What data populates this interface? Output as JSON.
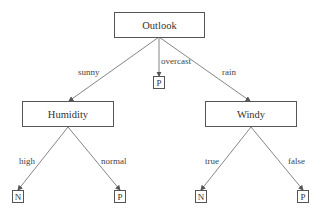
{
  "diagram": {
    "type": "decision-tree",
    "nodes": {
      "root": {
        "label": "Outlook"
      },
      "humidity": {
        "label": "Humidity"
      },
      "windy": {
        "label": "Windy"
      },
      "overcast_leaf": {
        "label": "P"
      },
      "high_leaf": {
        "label": "N"
      },
      "normal_leaf": {
        "label": "P"
      },
      "true_leaf": {
        "label": "N"
      },
      "false_leaf": {
        "label": "P"
      }
    },
    "edges": {
      "sunny": {
        "label": "sunny",
        "from": "Outlook",
        "to": "Humidity"
      },
      "overcast": {
        "label": "overcast",
        "from": "Outlook",
        "to": "P"
      },
      "rain": {
        "label": "rain",
        "from": "Outlook",
        "to": "Windy"
      },
      "high": {
        "label": "high",
        "from": "Humidity",
        "to": "N"
      },
      "normal": {
        "label": "normal",
        "from": "Humidity",
        "to": "P"
      },
      "true": {
        "label": "true",
        "from": "Windy",
        "to": "N"
      },
      "false": {
        "label": "false",
        "from": "Windy",
        "to": "P"
      }
    },
    "colors": {
      "line": "#777777",
      "border": "#555555",
      "text": "#333333"
    }
  }
}
